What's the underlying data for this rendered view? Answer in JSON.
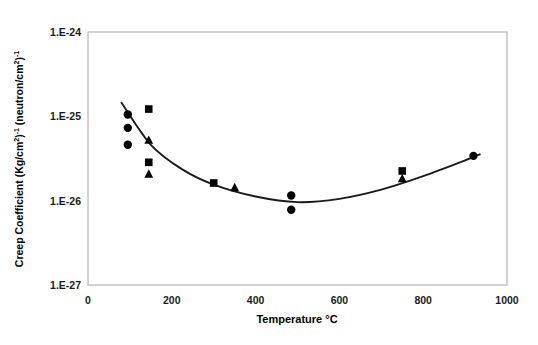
{
  "chart_data": {
    "type": "scatter",
    "title": "",
    "xlabel": "Temperature °C",
    "ylabel": "Creep Coefficient (Kg/cm2)-1 (neutron/cm2)-1",
    "ylabel_parts": {
      "a": "Creep Coefficient (Kg/cm",
      "sup1": "2",
      "b": ")",
      "sup2": "-1",
      "c": " (neutron/cm",
      "sup3": "2",
      "d": ")",
      "sup4": "-1"
    },
    "xlim": [
      0,
      1000
    ],
    "ylim": [
      1e-27,
      1e-24
    ],
    "yscale": "log",
    "xticks": [
      0,
      200,
      400,
      600,
      800,
      1000
    ],
    "xtick_labels": [
      "0",
      "200",
      "400",
      "600",
      "800",
      "1000"
    ],
    "yticks": [
      1e-24,
      1e-25,
      1e-26,
      1e-27
    ],
    "ytick_labels": [
      "1.E-24",
      "1.E-25",
      "1.E-26",
      "1.E-27"
    ],
    "grid": false,
    "legend": "none",
    "marker_color": "#000000",
    "curve_color": "#1a1a1a",
    "frame_color": "#b0b0b0",
    "series": [
      {
        "name": "circle-series",
        "marker": "circle",
        "points": [
          {
            "x": 95,
            "y": 1.05e-25
          },
          {
            "x": 95,
            "y": 7.3e-26
          },
          {
            "x": 95,
            "y": 4.6e-26
          },
          {
            "x": 485,
            "y": 1.15e-26
          },
          {
            "x": 485,
            "y": 7.8e-27
          },
          {
            "x": 920,
            "y": 3.4e-26
          }
        ]
      },
      {
        "name": "square-series",
        "marker": "square",
        "points": [
          {
            "x": 145,
            "y": 1.22e-25
          },
          {
            "x": 145,
            "y": 2.85e-26
          },
          {
            "x": 300,
            "y": 1.62e-26
          },
          {
            "x": 750,
            "y": 2.25e-26
          }
        ]
      },
      {
        "name": "triangle-series",
        "marker": "triangle",
        "points": [
          {
            "x": 145,
            "y": 5.3e-26
          },
          {
            "x": 145,
            "y": 2.1e-26
          },
          {
            "x": 350,
            "y": 1.45e-26
          },
          {
            "x": 750,
            "y": 1.85e-26
          }
        ]
      },
      {
        "name": "fit-curve",
        "marker": "line",
        "points": [
          {
            "x": 80,
            "y": 1.45e-25
          },
          {
            "x": 150,
            "y": 4.6e-26
          },
          {
            "x": 225,
            "y": 2.35e-26
          },
          {
            "x": 300,
            "y": 1.55e-26
          },
          {
            "x": 400,
            "y": 1.12e-26
          },
          {
            "x": 500,
            "y": 9.6e-27
          },
          {
            "x": 600,
            "y": 1.05e-26
          },
          {
            "x": 700,
            "y": 1.35e-26
          },
          {
            "x": 800,
            "y": 1.95e-26
          },
          {
            "x": 900,
            "y": 3e-26
          },
          {
            "x": 935,
            "y": 3.55e-26
          }
        ]
      }
    ]
  }
}
